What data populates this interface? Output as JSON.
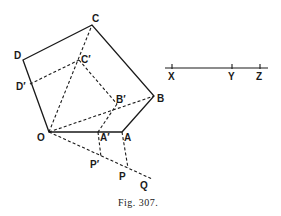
{
  "figure": {
    "caption": "Fig. 307.",
    "labels": {
      "C": "C",
      "D": "D",
      "C_prime": "C′",
      "D_prime": "D′",
      "B": "B",
      "B_prime": "B′",
      "O": "O",
      "A": "A",
      "A_prime": "A′",
      "P": "P",
      "P_prime": "P′",
      "Q": "Q"
    },
    "scale_line": {
      "labels": {
        "X": "X",
        "Y": "Y",
        "Z": "Z"
      }
    }
  },
  "points": {
    "O": [
      49,
      132
    ],
    "A": [
      122,
      132
    ],
    "B": [
      154,
      96
    ],
    "C": [
      92,
      25
    ],
    "D": [
      23,
      60
    ],
    "A_prime": [
      98,
      132
    ],
    "B_prime": [
      117,
      104
    ],
    "C_prime": [
      79,
      60
    ],
    "D_prime": [
      30,
      84
    ],
    "P": [
      128,
      168
    ],
    "P_prime": [
      101,
      157
    ],
    "Q": [
      152,
      179
    ],
    "X": [
      172,
      68
    ],
    "Y": [
      232,
      68
    ],
    "Z": [
      260,
      68
    ]
  }
}
